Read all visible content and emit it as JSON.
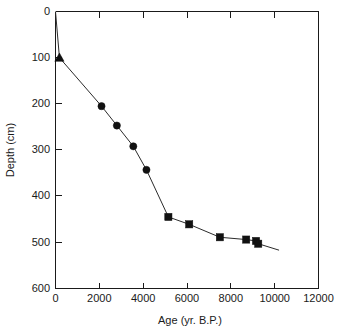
{
  "chart_data": {
    "type": "line",
    "title": "",
    "subtitle": "",
    "xlabel": "Age (yr. B.P.)",
    "ylabel": "Depth (cm)",
    "xlim": [
      0,
      12000
    ],
    "ylim": [
      0,
      600
    ],
    "y_inverted": true,
    "grid": false,
    "legend": "none",
    "xticks": [
      0,
      2000,
      4000,
      6000,
      8000,
      10000,
      12000
    ],
    "xtick_labels": [
      "0",
      "2000",
      "4000",
      "6000",
      "8000",
      "10000",
      "12000"
    ],
    "yticks": [
      0,
      100,
      200,
      300,
      400,
      500,
      600
    ],
    "ytick_labels": [
      "0",
      "100",
      "200",
      "300",
      "400",
      "500",
      "600"
    ],
    "series": [
      {
        "name": "age-depth-curve",
        "marker": "none",
        "line": "solid",
        "color": "#2b2b2b",
        "x": [
          0,
          180,
          2100,
          2800,
          3550,
          4150,
          5150,
          6100,
          7500,
          8700,
          9150,
          9250,
          10200
        ],
        "y": [
          0,
          100,
          205,
          247,
          292,
          343,
          445,
          461,
          489,
          494,
          497,
          503,
          517
        ]
      },
      {
        "name": "surface-triangle-marker",
        "marker": "triangle",
        "color": "#111111",
        "x": [
          180
        ],
        "y": [
          100
        ]
      },
      {
        "name": "circle-markers",
        "marker": "circle",
        "color": "#111111",
        "x": [
          2100,
          2800,
          3550,
          4150
        ],
        "y": [
          205,
          247,
          292,
          343
        ]
      },
      {
        "name": "square-markers",
        "marker": "square",
        "color": "#111111",
        "x": [
          5150,
          6100,
          7500,
          8700,
          9150,
          9250
        ],
        "y": [
          445,
          461,
          489,
          494,
          497,
          503
        ]
      }
    ]
  },
  "axes": {
    "x_title": "Age (yr. B.P.)",
    "y_title": "Depth (cm)"
  },
  "ticks": {
    "x": [
      "0",
      "2000",
      "4000",
      "6000",
      "8000",
      "10000",
      "12000"
    ],
    "y": [
      "0",
      "100",
      "200",
      "300",
      "400",
      "500",
      "600"
    ]
  },
  "colors": {
    "axis": "#1a1a1a",
    "line": "#2b2b2b",
    "marker": "#111111",
    "background": "#ffffff"
  }
}
